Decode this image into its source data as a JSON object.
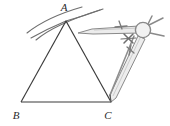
{
  "figure": {
    "type": "geometry-construction",
    "canvas": {
      "width": 170,
      "height": 126
    },
    "colors": {
      "triangle_stroke": "#3a3a3a",
      "arc_stroke": "#6e6e6e",
      "compass_body": "#8c8c8c",
      "compass_fill": "#e8e8e8",
      "label_color": "#2b2b2b",
      "background": "#ffffff"
    },
    "labels": [
      {
        "name": "vertex-label-a",
        "text": "A",
        "x": 64,
        "y": 11
      },
      {
        "name": "vertex-label-b",
        "text": "B",
        "x": 16,
        "y": 118
      },
      {
        "name": "vertex-label-c",
        "text": "C",
        "x": 107,
        "y": 118
      }
    ],
    "triangle": {
      "name": "triangle-abc",
      "vertices": {
        "A": {
          "x": 66,
          "y": 21
        },
        "B": {
          "x": 21,
          "y": 102
        },
        "C": {
          "x": 111,
          "y": 102
        }
      },
      "sides": [
        "AB",
        "BC",
        "CA"
      ],
      "stroke_width": 1.1
    },
    "construction_arcs": [
      {
        "name": "construction-arc-from-b",
        "description": "arc centred at B crossing through A",
        "path": "M 28 30 Q 50 16 79 8"
      },
      {
        "name": "construction-arc-from-c",
        "description": "arc centred at C crossing through A",
        "path": "M 40 40 Q 60 22 96 12"
      },
      {
        "name": "construction-arc-extra-left",
        "description": "short arc stroke left of A",
        "path": "M 33 38 Q 48 29 64 22"
      },
      {
        "name": "construction-arc-extra-right",
        "description": "short arc stroke right of A",
        "path": "M 66 21 Q 83 17 100 11"
      }
    ],
    "compass": {
      "name": "compass-tool",
      "parts": [
        {
          "name": "compass-hinge-knob",
          "cx": 143,
          "cy": 30,
          "r": 8
        },
        {
          "name": "compass-upper-arm",
          "description": "horizontal arm from hinge toward A"
        },
        {
          "name": "compass-pencil-leg",
          "description": "leg running down to vertex C"
        },
        {
          "name": "compass-adjust-screw",
          "description": "x-shaped thumb screw on arm"
        },
        {
          "name": "compass-top-fork",
          "description": "small fork at top right of knob"
        },
        {
          "name": "compass-needle-point",
          "description": "point resting at C"
        }
      ]
    }
  }
}
